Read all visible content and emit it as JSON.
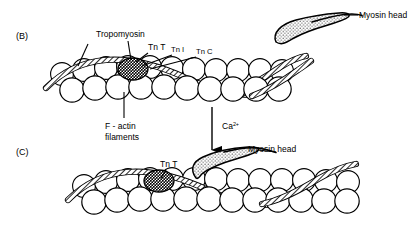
{
  "figure": {
    "background_color": "#ffffff",
    "line_color": "#000000",
    "panels": [
      {
        "id": "B",
        "label": "(B)"
      },
      {
        "id": "C",
        "label": "(C)"
      }
    ],
    "labels": {
      "tropomyosin": "Tropomyosin",
      "tn_t": "Tn T",
      "tn_i": "Tn I",
      "tn_c": "Tn C",
      "f_actin_line1": "F - actin",
      "f_actin_line2": "filaments",
      "myosin_head": "Myosin head",
      "myosin_head_c": "Myosin head",
      "tn_t_c": "Tn T",
      "calcium": "Ca",
      "calcium_superscript": "2+"
    },
    "colors": {
      "actin_bead_fill": "#ffffff",
      "tropomyosin_fill": "#9a9a9a",
      "troponin_fill": "#2a2a2a",
      "myosin_fill": "#d0d0d0",
      "stroke": "#000000"
    }
  }
}
